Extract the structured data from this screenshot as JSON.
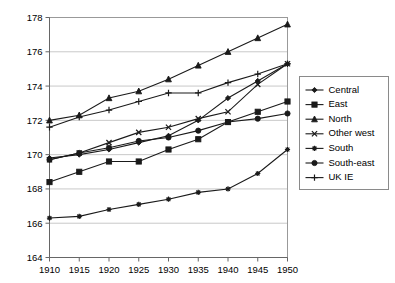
{
  "chart_data": {
    "type": "line",
    "title": "",
    "subtitle": "",
    "xlabel": "",
    "ylabel": "",
    "x": [
      1910,
      1915,
      1920,
      1925,
      1930,
      1935,
      1940,
      1945,
      1950
    ],
    "xtick_labels": [
      "1910",
      "1915",
      "1920",
      "1925",
      "1930",
      "1935",
      "1940",
      "1945",
      "1950"
    ],
    "ytick_labels": [
      "164",
      "166",
      "168",
      "170",
      "172",
      "174",
      "176",
      "178"
    ],
    "yticks": [
      164,
      166,
      168,
      170,
      172,
      174,
      176,
      178
    ],
    "xlim": [
      1910,
      1950
    ],
    "ylim": [
      164,
      178
    ],
    "grid": "horizontal",
    "legend_position": "right",
    "series": [
      {
        "name": "Central",
        "marker": "diamond",
        "values": [
          169.8,
          170.0,
          170.3,
          170.7,
          171.1,
          172.0,
          173.3,
          174.3,
          175.3
        ]
      },
      {
        "name": "East",
        "marker": "square",
        "values": [
          168.4,
          169.0,
          169.6,
          169.6,
          170.3,
          170.9,
          171.9,
          172.5,
          173.1
        ]
      },
      {
        "name": "North",
        "marker": "triangle",
        "values": [
          172.0,
          172.3,
          173.3,
          173.7,
          174.4,
          175.2,
          176.0,
          176.8,
          177.6
        ]
      },
      {
        "name": "Other west",
        "marker": "cross-x",
        "values": [
          169.7,
          170.1,
          170.7,
          171.3,
          171.6,
          172.1,
          172.5,
          174.1,
          175.3
        ]
      },
      {
        "name": "South",
        "marker": "asterisk",
        "values": [
          166.3,
          166.4,
          166.8,
          167.1,
          167.4,
          167.8,
          168.0,
          168.9,
          170.3
        ]
      },
      {
        "name": "South-east",
        "marker": "circle",
        "values": [
          169.7,
          170.1,
          170.4,
          170.8,
          171.0,
          171.4,
          171.9,
          172.1,
          172.4
        ]
      },
      {
        "name": "UK IE",
        "marker": "plus",
        "values": [
          171.6,
          172.2,
          172.6,
          173.1,
          173.6,
          173.6,
          174.2,
          174.7,
          175.3
        ]
      }
    ]
  },
  "legend": {
    "items": [
      {
        "label": "Central"
      },
      {
        "label": "East"
      },
      {
        "label": "North"
      },
      {
        "label": "Other west"
      },
      {
        "label": "South"
      },
      {
        "label": "South-east"
      },
      {
        "label": "UK IE"
      }
    ]
  },
  "colors": {
    "series": "#1a1a1a",
    "grid": "#b0b0b0",
    "axis": "#666666",
    "background": "#ffffff"
  }
}
